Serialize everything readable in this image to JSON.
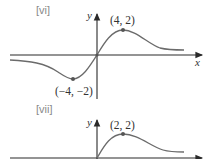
{
  "figures": [
    {
      "label": "[vi]",
      "y_axis_label": "y",
      "x_axis_label": "x",
      "points": [
        {
          "text": "(4, 2)",
          "x": 4,
          "y": 2,
          "type": "maximum"
        },
        {
          "text": "(−4, −2)",
          "x": -4,
          "y": -2,
          "type": "minimum"
        }
      ],
      "passes_through_origin": true,
      "asymptote": "y = 0"
    },
    {
      "label": "[vii]",
      "y_axis_label": "y",
      "points": [
        {
          "text": "(2, 2)",
          "x": 2,
          "y": 2,
          "type": "maximum"
        }
      ],
      "starts_at_origin": true,
      "asymptote": "y = 0"
    }
  ],
  "colors": {
    "curve": "#6b6b6b",
    "axis": "#2a2a2a",
    "label": "#8a8a8a"
  }
}
